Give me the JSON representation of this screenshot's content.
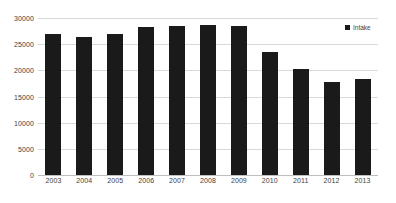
{
  "chart_data": {
    "type": "bar",
    "title": "",
    "xlabel": "",
    "ylabel": "",
    "categories": [
      "2003",
      "2004",
      "2005",
      "2006",
      "2007",
      "2008",
      "2009",
      "2010",
      "2011",
      "2012",
      "2013"
    ],
    "series": [
      {
        "name": "Intake",
        "color": "#1a1a1a",
        "values": [
          26900,
          26400,
          26900,
          28200,
          28400,
          28600,
          28400,
          23500,
          20200,
          17800,
          18300
        ]
      }
    ],
    "ylim": [
      0,
      30000
    ],
    "ytick_values": [
      0,
      5000,
      10000,
      15000,
      20000,
      25000,
      30000
    ],
    "ytick_labels": [
      "0",
      "5000",
      "10000",
      "15000",
      "20000",
      "25000",
      "30000"
    ],
    "grid": true,
    "grid_color": "#d9d9d9",
    "axis_color": "#bfbfbf",
    "background": "#ffffff",
    "legend": {
      "position": "top-right",
      "entries": [
        {
          "label": "Intake",
          "color": "#1a1a1a",
          "marker": "square-marker-icon"
        }
      ]
    }
  }
}
